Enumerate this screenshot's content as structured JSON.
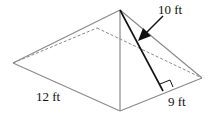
{
  "diagram": {
    "type": "pyramid",
    "labels": {
      "slant_height": "10 ft",
      "base_length": "12 ft",
      "base_width": "9 ft"
    },
    "colors": {
      "edge": "#8a8a8a",
      "slant": "#111111",
      "background": "#ffffff"
    }
  }
}
